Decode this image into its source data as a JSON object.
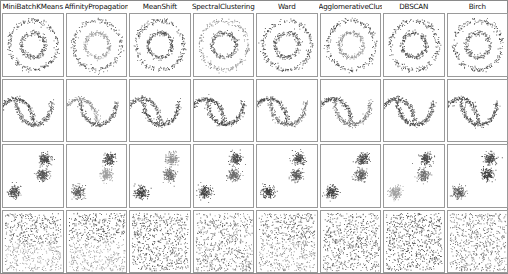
{
  "figure": {
    "kind": "clustering-algorithm-comparison-grid",
    "columns": 8,
    "rows": 4,
    "background_color": "#ffffff",
    "border_color": "#8a8a8a"
  },
  "column_titles": [
    "MiniBatchKMeans",
    "AffinityPropagation",
    "MeanShift",
    "SpectralClustering",
    "Ward",
    "AgglomerativeClustering",
    "DBSCAN",
    "Birch"
  ],
  "row_datasets": [
    "noisy_circles",
    "noisy_moons",
    "blobs",
    "uniform_noise"
  ],
  "palette": {
    "cluster_0": "#4d4d4d",
    "cluster_1": "#8f8f8f",
    "cluster_2": "#5f5f5f",
    "cluster_3": "#a8a8a8",
    "point_dark": "#4a4a4a",
    "point_mid": "#717171",
    "point_light": "#9e9e9e"
  },
  "chart_data": {
    "type": "scatter",
    "title": "",
    "xlabel": "",
    "ylabel": "",
    "xlim": [
      -2.5,
      2.5
    ],
    "ylim": [
      -2.5,
      2.5
    ],
    "grid": false,
    "legend": "none",
    "axis_ticks": "hidden",
    "panels": [
      {
        "row": 0,
        "col": 0,
        "dataset": "noisy_circles",
        "algorithm": "MiniBatchKMeans",
        "clusters": 2,
        "cluster_colors": [
          "#4d4d4d",
          "#5c5c5c"
        ],
        "shape": "two_concentric_rings",
        "assignment": "outer_ring_dark,inner_ring_dark"
      },
      {
        "row": 0,
        "col": 1,
        "dataset": "noisy_circles",
        "algorithm": "AffinityPropagation",
        "clusters": 2,
        "cluster_colors": [
          "#5a5a5a",
          "#9e9e9e"
        ],
        "shape": "two_concentric_rings",
        "assignment": "outer_ring_dark,inner_ring_light"
      },
      {
        "row": 0,
        "col": 2,
        "dataset": "noisy_circles",
        "algorithm": "MeanShift",
        "clusters": 2,
        "cluster_colors": [
          "#4d4d4d",
          "#4d4d4d"
        ],
        "shape": "two_concentric_rings",
        "assignment": "both_rings_dark"
      },
      {
        "row": 0,
        "col": 3,
        "dataset": "noisy_circles",
        "algorithm": "SpectralClustering",
        "clusters": 2,
        "cluster_colors": [
          "#8c8c8c",
          "#5a5a5a"
        ],
        "shape": "two_concentric_rings",
        "assignment": "outer_ring_light,inner_ring_dark"
      },
      {
        "row": 0,
        "col": 4,
        "dataset": "noisy_circles",
        "algorithm": "Ward",
        "clusters": 2,
        "cluster_colors": [
          "#4d4d4d",
          "#5c5c5c"
        ],
        "shape": "two_concentric_rings",
        "assignment": "both_rings_dark"
      },
      {
        "row": 0,
        "col": 5,
        "dataset": "noisy_circles",
        "algorithm": "AgglomerativeClustering",
        "clusters": 2,
        "cluster_colors": [
          "#4d4d4d",
          "#8f8f8f"
        ],
        "shape": "two_concentric_rings",
        "assignment": "outer_ring_dark,inner_ring_light"
      },
      {
        "row": 0,
        "col": 6,
        "dataset": "noisy_circles",
        "algorithm": "DBSCAN",
        "clusters": 2,
        "cluster_colors": [
          "#4a4a4a",
          "#4a4a4a"
        ],
        "shape": "two_concentric_rings",
        "assignment": "both_rings_dark"
      },
      {
        "row": 0,
        "col": 7,
        "dataset": "noisy_circles",
        "algorithm": "Birch",
        "clusters": 2,
        "cluster_colors": [
          "#4d4d4d",
          "#5c5c5c"
        ],
        "shape": "two_concentric_rings",
        "assignment": "both_rings_dark"
      },
      {
        "row": 1,
        "col": 0,
        "dataset": "noisy_moons",
        "algorithm": "MiniBatchKMeans",
        "clusters": 2,
        "cluster_colors": [
          "#4a4a4a",
          "#5c5c5c"
        ],
        "shape": "two_interleaving_moons",
        "assignment": "both_moons_dark"
      },
      {
        "row": 1,
        "col": 1,
        "dataset": "noisy_moons",
        "algorithm": "AffinityPropagation",
        "clusters": 2,
        "cluster_colors": [
          "#8f8f8f",
          "#5c5c5c"
        ],
        "shape": "two_interleaving_moons",
        "assignment": "upper_moon_light,lower_moon_dark"
      },
      {
        "row": 1,
        "col": 2,
        "dataset": "noisy_moons",
        "algorithm": "MeanShift",
        "clusters": 2,
        "cluster_colors": [
          "#5c5c5c",
          "#4a4a4a"
        ],
        "shape": "two_interleaving_moons",
        "assignment": "both_moons_dark"
      },
      {
        "row": 1,
        "col": 3,
        "dataset": "noisy_moons",
        "algorithm": "SpectralClustering",
        "clusters": 2,
        "cluster_colors": [
          "#4a4a4a",
          "#4a4a4a"
        ],
        "shape": "two_interleaving_moons",
        "assignment": "both_moons_dark"
      },
      {
        "row": 1,
        "col": 4,
        "dataset": "noisy_moons",
        "algorithm": "Ward",
        "clusters": 2,
        "cluster_colors": [
          "#4a4a4a",
          "#6b6b6b"
        ],
        "shape": "two_interleaving_moons",
        "assignment": "both_moons_dark"
      },
      {
        "row": 1,
        "col": 5,
        "dataset": "noisy_moons",
        "algorithm": "AgglomerativeClustering",
        "clusters": 2,
        "cluster_colors": [
          "#4a4a4a",
          "#7a7a7a"
        ],
        "shape": "two_interleaving_moons",
        "assignment": "upper_moon_dark,lower_moon_mid"
      },
      {
        "row": 1,
        "col": 6,
        "dataset": "noisy_moons",
        "algorithm": "DBSCAN",
        "clusters": 2,
        "cluster_colors": [
          "#4a4a4a",
          "#4a4a4a"
        ],
        "shape": "two_interleaving_moons",
        "assignment": "both_moons_dark"
      },
      {
        "row": 1,
        "col": 7,
        "dataset": "noisy_moons",
        "algorithm": "Birch",
        "clusters": 2,
        "cluster_colors": [
          "#4a4a4a",
          "#4a4a4a"
        ],
        "shape": "two_interleaving_moons",
        "assignment": "both_moons_dark"
      },
      {
        "row": 2,
        "col": 0,
        "dataset": "blobs",
        "algorithm": "MiniBatchKMeans",
        "clusters": 3,
        "cluster_colors": [
          "#4a4a4a",
          "#565656",
          "#515151"
        ],
        "shape": "three_blobs",
        "assignment": "all_blobs_dark"
      },
      {
        "row": 2,
        "col": 1,
        "dataset": "blobs",
        "algorithm": "AffinityPropagation",
        "clusters": 3,
        "cluster_colors": [
          "#4a4a4a",
          "#9e9e9e",
          "#5c5c5c"
        ],
        "shape": "three_blobs",
        "assignment": "middle_blob_light"
      },
      {
        "row": 2,
        "col": 2,
        "dataset": "blobs",
        "algorithm": "MeanShift",
        "clusters": 3,
        "cluster_colors": [
          "#8f8f8f",
          "#6b6b6b",
          "#3f3f3f"
        ],
        "shape": "three_blobs",
        "assignment": "top_blob_light,bottom_blob_darkest"
      },
      {
        "row": 2,
        "col": 3,
        "dataset": "blobs",
        "algorithm": "SpectralClustering",
        "clusters": 3,
        "cluster_colors": [
          "#4a4a4a",
          "#6b6b6b",
          "#3f3f3f"
        ],
        "shape": "three_blobs",
        "assignment": "all_blobs_dark"
      },
      {
        "row": 2,
        "col": 4,
        "dataset": "blobs",
        "algorithm": "Ward",
        "clusters": 3,
        "cluster_colors": [
          "#4a4a4a",
          "#5c5c5c",
          "#3f3f3f"
        ],
        "shape": "three_blobs",
        "assignment": "all_blobs_dark"
      },
      {
        "row": 2,
        "col": 5,
        "dataset": "blobs",
        "algorithm": "AgglomerativeClustering",
        "clusters": 3,
        "cluster_colors": [
          "#4a4a4a",
          "#5c5c5c",
          "#3f3f3f"
        ],
        "shape": "three_blobs",
        "assignment": "all_blobs_dark"
      },
      {
        "row": 2,
        "col": 6,
        "dataset": "blobs",
        "algorithm": "DBSCAN",
        "clusters": 3,
        "cluster_colors": [
          "#4a4a4a",
          "#6b6b6b",
          "#9e9e9e"
        ],
        "shape": "three_blobs",
        "assignment": "bottom_blob_light"
      },
      {
        "row": 2,
        "col": 7,
        "dataset": "blobs",
        "algorithm": "Birch",
        "clusters": 3,
        "cluster_colors": [
          "#4a4a4a",
          "#3f3f3f",
          "#5c5c5c"
        ],
        "shape": "three_blobs",
        "assignment": "all_blobs_dark"
      },
      {
        "row": 3,
        "col": 0,
        "dataset": "uniform_noise",
        "algorithm": "MiniBatchKMeans",
        "clusters": 2,
        "cluster_colors": [
          "#545454",
          "#9a9a9a"
        ],
        "shape": "uniform_square",
        "assignment": "top_half_dark,bottom_half_light"
      },
      {
        "row": 3,
        "col": 1,
        "dataset": "uniform_noise",
        "algorithm": "AffinityPropagation",
        "clusters": 2,
        "cluster_colors": [
          "#545454",
          "#9a9a9a"
        ],
        "shape": "uniform_square",
        "assignment": "top_half_dark,bottom_half_light"
      },
      {
        "row": 3,
        "col": 2,
        "dataset": "uniform_noise",
        "algorithm": "MeanShift",
        "clusters": 1,
        "cluster_colors": [
          "#545454"
        ],
        "shape": "uniform_square",
        "assignment": "single_cluster_dark"
      },
      {
        "row": 3,
        "col": 3,
        "dataset": "uniform_noise",
        "algorithm": "SpectralClustering",
        "clusters": 2,
        "cluster_colors": [
          "#545454",
          "#8a8a8a"
        ],
        "shape": "uniform_square",
        "assignment": "mixed_dark"
      },
      {
        "row": 3,
        "col": 4,
        "dataset": "uniform_noise",
        "algorithm": "Ward",
        "clusters": 2,
        "cluster_colors": [
          "#5c5c5c",
          "#8a8a8a"
        ],
        "shape": "uniform_square",
        "assignment": "top_half_mid,bottom_half_mid"
      },
      {
        "row": 3,
        "col": 5,
        "dataset": "uniform_noise",
        "algorithm": "AgglomerativeClustering",
        "clusters": 2,
        "cluster_colors": [
          "#545454",
          "#6e6e6e"
        ],
        "shape": "uniform_square",
        "assignment": "mixed_dark"
      },
      {
        "row": 3,
        "col": 6,
        "dataset": "uniform_noise",
        "algorithm": "DBSCAN",
        "clusters": 1,
        "cluster_colors": [
          "#4a4a4a"
        ],
        "shape": "uniform_square",
        "assignment": "single_cluster_dark"
      },
      {
        "row": 3,
        "col": 7,
        "dataset": "uniform_noise",
        "algorithm": "Birch",
        "clusters": 1,
        "cluster_colors": [
          "#6e6e6e"
        ],
        "shape": "uniform_square",
        "assignment": "single_cluster_mid"
      }
    ]
  }
}
